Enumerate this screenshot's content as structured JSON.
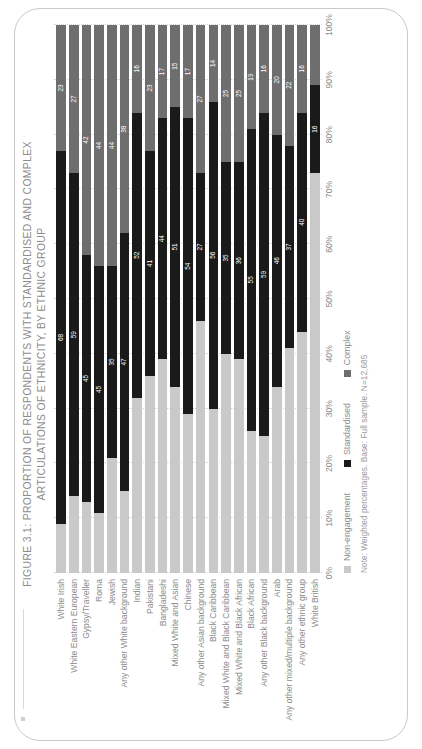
{
  "figure": {
    "title_line1": "FIGURE 3.1: PROPORTION OF RESPONDENTS WITH STANDARDISED AND COMPLEX",
    "title_line2": "ARTICULATIONS OF ETHNICITY, BY ETHNIC GROUP",
    "note": "Note: Weighted percentages. Base: Full sample. N=12,685"
  },
  "colors": {
    "non_engagement": "#c9c9c9",
    "standardised": "#1a1a1a",
    "complex": "#6e6e6e",
    "text": "#8b8b8b",
    "grid": "#d3d3d3"
  },
  "legend": {
    "items": [
      {
        "label": "Non-engagement",
        "color": "#c9c9c9"
      },
      {
        "label": "Standardised",
        "color": "#1a1a1a"
      },
      {
        "label": "Complex",
        "color": "#6e6e6e"
      }
    ]
  },
  "chart_data": {
    "type": "bar",
    "orientation": "horizontal",
    "stacked": "percent",
    "title": "FIGURE 3.1: PROPORTION OF RESPONDENTS WITH STANDARDISED AND COMPLEX ARTICULATIONS OF ETHNICITY, BY ETHNIC GROUP",
    "xlabel": "",
    "ylabel": "",
    "xlim": [
      0,
      100
    ],
    "xticks": [
      "0%",
      "10%",
      "20%",
      "30%",
      "40%",
      "50%",
      "60%",
      "70%",
      "80%",
      "90%",
      "100%"
    ],
    "grid": true,
    "legend_position": "bottom",
    "categories": [
      "White Irish",
      "White Eastern European",
      "Gypsy/Traveller",
      "Roma",
      "Jewish",
      "Any other White background",
      "Indian",
      "Pakistani",
      "Bangladeshi",
      "Mixed White and Asian",
      "Chinese",
      "Any other Asian background",
      "Black Caribbean",
      "Mixed White and Black Caribbean",
      "Mixed White and Black African",
      "Black African",
      "Any other Black background",
      "Arab",
      "Any other mixed/multiple background",
      "Any other ethnic group",
      "White British"
    ],
    "series": [
      {
        "name": "Non-engagement",
        "color": "#c9c9c9",
        "values": [
          9,
          14,
          13,
          11,
          21,
          15,
          32,
          36,
          39,
          34,
          29,
          46,
          30,
          40,
          39,
          26,
          25,
          34,
          41,
          44,
          73
        ]
      },
      {
        "name": "Standardised",
        "color": "#1a1a1a",
        "values": [
          68,
          59,
          45,
          45,
          35,
          47,
          52,
          41,
          44,
          51,
          54,
          27,
          56,
          35,
          36,
          55,
          59,
          46,
          37,
          40,
          16
        ]
      },
      {
        "name": "Complex",
        "color": "#6e6e6e",
        "values": [
          23,
          27,
          42,
          44,
          44,
          38,
          16,
          23,
          17,
          15,
          17,
          27,
          14,
          25,
          25,
          19,
          16,
          20,
          22,
          16,
          11
        ]
      }
    ],
    "data_labels": {
      "standardised": [
        68,
        59,
        45,
        45,
        35,
        47,
        52,
        41,
        44,
        51,
        54,
        27,
        56,
        35,
        36,
        55,
        59,
        46,
        37,
        40,
        16
      ],
      "complex": [
        23,
        27,
        42,
        44,
        44,
        38,
        16,
        23,
        17,
        15,
        17,
        27,
        14,
        25,
        25,
        19,
        16,
        20,
        22,
        16,
        11
      ]
    }
  }
}
